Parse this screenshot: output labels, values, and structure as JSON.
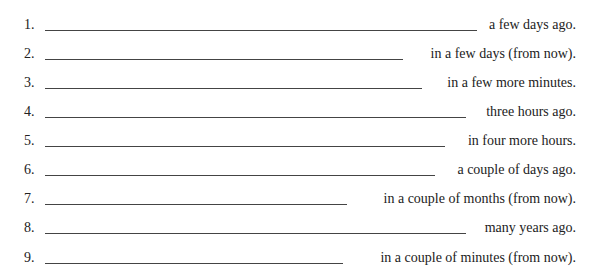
{
  "items": [
    {
      "number": "1.",
      "phrase": "a few days ago.",
      "blank_end": 477
    },
    {
      "number": "2.",
      "phrase": "in a few days (from now).",
      "blank_end": 403
    },
    {
      "number": "3.",
      "phrase": "in a few more minutes.",
      "blank_end": 422
    },
    {
      "number": "4.",
      "phrase": "three hours ago.",
      "blank_end": 466
    },
    {
      "number": "5.",
      "phrase": "in four more hours.",
      "blank_end": 445
    },
    {
      "number": "6.",
      "phrase": "a couple of days ago.",
      "blank_end": 435
    },
    {
      "number": "7.",
      "phrase": "in a couple of months (from now).",
      "blank_end": 347
    },
    {
      "number": "8.",
      "phrase": "many years ago.",
      "blank_end": 466
    },
    {
      "number": "9.",
      "phrase": "in a couple of minutes (from now).",
      "blank_end": 343
    }
  ]
}
